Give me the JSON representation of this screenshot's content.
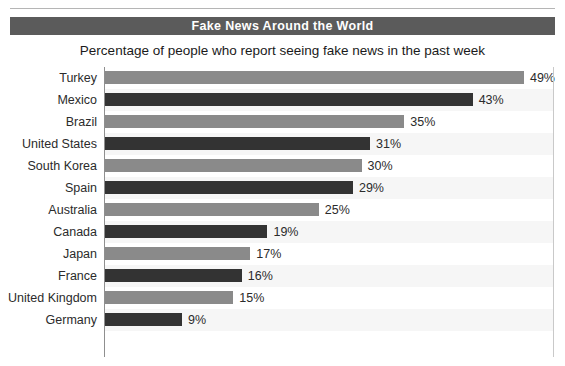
{
  "header": {
    "title": "Fake News Around the World",
    "subtitle": "Percentage of people who report seeing fake news in the past week"
  },
  "colors": {
    "title_band": "#5b5b5b",
    "title_text": "#ffffff",
    "bar_light": "#8a8a8a",
    "bar_dark": "#333333",
    "axis": "#8f8f8f",
    "gridline": "#c9c9c9",
    "row_band": "#f6f6f6"
  },
  "chart_data": {
    "type": "bar",
    "orientation": "horizontal",
    "title": "Fake News Around the World",
    "subtitle": "Percentage of people who report seeing fake news in the past week",
    "xlabel": "",
    "ylabel": "",
    "xlim": [
      0,
      53
    ],
    "grid": false,
    "legend": null,
    "value_suffix": "%",
    "categories": [
      "Turkey",
      "Mexico",
      "Brazil",
      "United States",
      "South Korea",
      "Spain",
      "Australia",
      "Canada",
      "Japan",
      "France",
      "United Kingdom",
      "Germany"
    ],
    "values": [
      49,
      43,
      35,
      31,
      30,
      29,
      25,
      19,
      17,
      16,
      15,
      9
    ],
    "value_labels": [
      "49%",
      "43%",
      "35%",
      "31%",
      "30%",
      "29%",
      "25%",
      "19%",
      "17%",
      "16%",
      "15%",
      "9%"
    ],
    "bar_colors": [
      "#8a8a8a",
      "#333333",
      "#8a8a8a",
      "#333333",
      "#8a8a8a",
      "#333333",
      "#8a8a8a",
      "#333333",
      "#8a8a8a",
      "#333333",
      "#8a8a8a",
      "#333333"
    ]
  }
}
